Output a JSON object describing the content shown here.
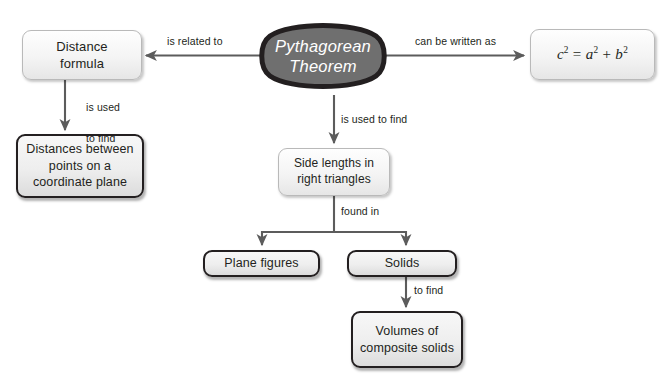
{
  "diagram": {
    "colors": {
      "center_fill": "#6f6f6f",
      "center_border": "#231f20",
      "center_text": "#ffffff",
      "box_fill": "#f0f0f0",
      "box_border_light": "#b9b9b9",
      "box_border_heavy": "#231f20",
      "edge_line": "#5c5c5c",
      "text": "#231f20",
      "background": "#ffffff"
    },
    "nodes": {
      "center": {
        "line1": "Pythagorean",
        "line2": "Theorem"
      },
      "distance_formula": {
        "line1": "Distance",
        "line2": "formula"
      },
      "equation": {
        "c": "c",
        "c_exp": "2",
        "eq": "=",
        "a": "a",
        "a_exp": "2",
        "plus": "+",
        "b": "b",
        "b_exp": "2",
        "plain": "c2 = a2 + b2"
      },
      "distances_between": {
        "line1": "Distances between",
        "line2": "points on a",
        "line3": "coordinate plane"
      },
      "side_lengths": {
        "line1": "Side lengths in",
        "line2": "right triangles"
      },
      "plane_figures": {
        "line1": "Plane figures"
      },
      "solids": {
        "line1": "Solids"
      },
      "volumes": {
        "line1": "Volumes of",
        "line2": "composite solids"
      }
    },
    "edge_labels": {
      "is_related_to": "is related to",
      "can_be_written_as": "can be written as",
      "is_used_to_find_left_1": "is used",
      "is_used_to_find_left_2": "to find",
      "is_used_to_find_center": "is used to find",
      "found_in": "found in",
      "to_find": "to find"
    }
  }
}
